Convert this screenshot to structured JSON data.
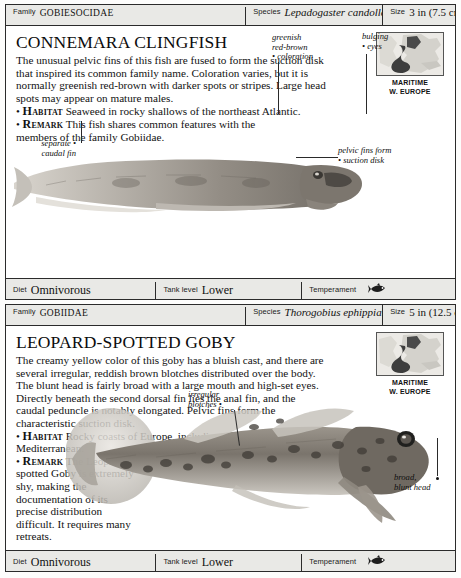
{
  "page": {
    "cards": [
      {
        "id": "connemara-clingfish",
        "header": {
          "family_label": "Family",
          "family_value": "Gobiesocidae",
          "species_label": "Species",
          "species_value": "Lepadogaster candollei",
          "size_label": "Size",
          "size_value": "3 in (7.5 cm)"
        },
        "title": "Connemara Clingfish",
        "description": "The unusual pelvic fins of this fish are fused to form the suction disk that inspired its common family name. Coloration varies, but it is normally greenish red-brown with darker spots or stripes. Large head spots may appear on mature males.",
        "habitat_keyword": "Habitat",
        "habitat_text": "Seaweed in rocky shallows of the northeast Atlantic.",
        "remark_keyword": "Remark",
        "remark_text": "This fish shares common features with the members of the family Gobiidae.",
        "map": {
          "line1": "MARITIME",
          "line2": "W. EUROPE"
        },
        "callouts": [
          {
            "name": "coloration",
            "text": "greenish\nred-brown\n• coloration"
          },
          {
            "name": "eyes",
            "text": "bulging\n• eyes"
          },
          {
            "name": "caudal-fin",
            "text": "separate •\ncaudal fin"
          },
          {
            "name": "suction-disk",
            "text": "pelvic fins form\n• suction disk"
          }
        ],
        "footer": {
          "diet_label": "Diet",
          "diet_value": "Omnivorous",
          "tank_label": "Tank level",
          "tank_value": "Lower",
          "temperament_label": "Temperament",
          "temperament_icon": "fish-icon"
        }
      },
      {
        "id": "leopard-spotted-goby",
        "header": {
          "family_label": "Family",
          "family_value": "Gobiidae",
          "species_label": "Species",
          "species_value": "Thorogobius ephippiatus",
          "size_label": "Size",
          "size_value": "5 in (12.5 cm)"
        },
        "title": "Leopard-spotted Goby",
        "description": "The creamy yellow color of this goby has a bluish cast, and there are several irregular, reddish brown blotches distributed over the body. The blunt head is fairly broad with a large mouth and high-set eyes. Directly beneath the second dorsal fin lies the anal fin, and the caudal peduncle is notably elongated. Pelvic fins form the characteristic suction disk.",
        "habitat_keyword": "Habitat",
        "habitat_text": "Rocky coasts of Europe, including the Mediterranean.",
        "remark_keyword": "Remark",
        "remark_text": "The Leopard-spotted Goby is extremely shy, making the documentation of its precise distribution difficult. It requires many retreats.",
        "map": {
          "line1": "MARITIME",
          "line2": "W. EUROPE"
        },
        "callouts": [
          {
            "name": "blotches",
            "text": "irregular\nblotches •"
          },
          {
            "name": "blunt-head",
            "text": "broad,\nblunt head"
          }
        ],
        "footer": {
          "diet_label": "Diet",
          "diet_value": "Omnivorous",
          "tank_label": "Tank level",
          "tank_value": "Lower",
          "temperament_label": "Temperament",
          "temperament_icon": "fish-icon"
        }
      }
    ]
  },
  "colors": {
    "bar_background": "#e9e9e6",
    "border": "#2b2b2b",
    "text": "#111111",
    "map_land": "#cfcfc9",
    "map_range": "#3a3a3a"
  }
}
